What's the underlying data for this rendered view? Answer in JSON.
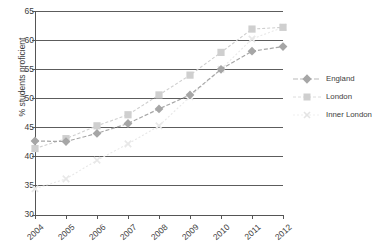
{
  "chart_data": {
    "type": "line",
    "title": "",
    "xlabel": "",
    "ylabel": "% students proficient",
    "categories": [
      "2004",
      "2005",
      "2006",
      "2007",
      "2008",
      "2009",
      "2010",
      "2011",
      "2012"
    ],
    "x": [
      2004,
      2005,
      2006,
      2007,
      2008,
      2009,
      2010,
      2011,
      2012
    ],
    "ylim": [
      30,
      65
    ],
    "yticks": [
      30,
      35,
      40,
      45,
      50,
      55,
      60,
      65
    ],
    "grid": "horizontal",
    "legend_position": "right",
    "series": [
      {
        "name": "England",
        "marker": "diamond",
        "color": "#a6a6a6",
        "values": [
          42.7,
          42.6,
          44.0,
          45.7,
          48.2,
          50.6,
          55.0,
          58.1,
          58.9
        ]
      },
      {
        "name": "London",
        "marker": "square",
        "color": "#cfcfcf",
        "values": [
          41.4,
          43.1,
          45.3,
          47.2,
          50.6,
          54.0,
          57.9,
          61.9,
          62.2
        ]
      },
      {
        "name": "Inner London",
        "marker": "cross",
        "color": "#e8e8e8",
        "values": [
          34.5,
          36.2,
          39.4,
          42.2,
          45.3,
          50.3,
          55.0,
          60.2,
          62.2
        ]
      }
    ]
  },
  "axis": {
    "y_tick_labels": [
      "65",
      "60",
      "55",
      "50",
      "45",
      "40",
      "35",
      "30"
    ],
    "x_tick_labels": [
      "2004",
      "2005",
      "2006",
      "2007",
      "2008",
      "2009",
      "2010",
      "2011",
      "2012"
    ],
    "y_axis_title": "% students proficient"
  },
  "legend": {
    "items": [
      {
        "label": "England",
        "marker": "diamond-marker",
        "color": "#a6a6a6"
      },
      {
        "label": "London",
        "marker": "square-marker",
        "color": "#cfcfcf"
      },
      {
        "label": "Inner London",
        "marker": "cross-marker",
        "color": "#e9e9e9"
      }
    ]
  },
  "colors": {
    "axis": "#555555",
    "grid": "#4a4a4a",
    "text": "#3d3d3d",
    "england": "#a6a6a6",
    "london": "#cfcfcf",
    "inner_london": "#e8e8e8"
  }
}
